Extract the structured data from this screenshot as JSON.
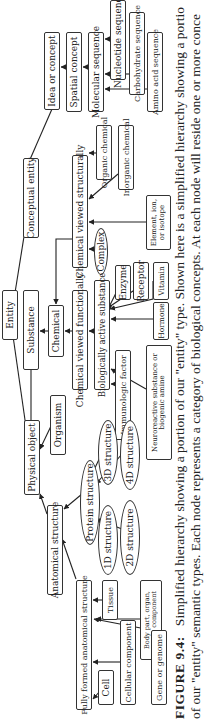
{
  "figure": {
    "caption_label": "FIGURE 9.4:",
    "caption_line1": "Simplified hierarchy showing a portion of our \"entity\" type. Shown here is a simplified hierarchy showing a portio",
    "caption_line2": "of our \"entity\" semantic types. Each node represents a category of biological concepts. At each node will reside one or more conce",
    "orientation": "rotated 90 degrees counter-clockwise"
  },
  "nodes": {
    "entity": "Entity",
    "physical_object": "Physical object",
    "conceptual_entity": "Conceptual entity",
    "idea_or_concept": "Idea or concept",
    "spatial_concept": "Spatial concept",
    "molecular_sequence": "Molecular sequence",
    "nucleotide_sequence": "Nucleotide sequence",
    "carbohydrate_sequence": "Carbohydrate sequence",
    "amino_acid_sequence": "Amino acid sequence",
    "substance": "Substance",
    "chemical": "Chemical",
    "chemical_viewed_structurally": "Chemical viewed structurally",
    "organic_chemical": "Organic chemical",
    "inorganic_chemical": "Inorganic chemical",
    "element_ion_isotope": "Element, ion, or isotope",
    "complex": "Complex",
    "chemical_viewed_functionally": "Chemical viewed functionally",
    "biologically_active_substance": "Biologically active substance",
    "enzyme": "Enzyme",
    "receptor": "Receptor",
    "vitamin": "Vitamin",
    "hormone": "Hormone",
    "immunologic_factor": "Immunologic factor",
    "neuroreactive_substance": "Neuroreactive substance or biogenic amine",
    "organism": "Organism",
    "anatomical_structure": "Anatomical structure",
    "protein_structure": "Protein structure",
    "structure_1d": "1D structure",
    "structure_2d": "2D structure",
    "structure_3d": "3D structure",
    "structure_4d": "4D structure",
    "fully_formed_anatomical_structure": "Fully formed anatomical structure",
    "cell": "Cell",
    "tissue": "Tissue",
    "cellular_component": "Cellular component",
    "body_part": "Body part, organ, organ component",
    "gene_or_genome": "Gene or genome"
  },
  "edges": [
    [
      "physical_object",
      "entity"
    ],
    [
      "conceptual_entity",
      "entity"
    ],
    [
      "idea_or_concept",
      "conceptual_entity"
    ],
    [
      "spatial_concept",
      "idea_or_concept"
    ],
    [
      "molecular_sequence",
      "spatial_concept"
    ],
    [
      "nucleotide_sequence",
      "molecular_sequence"
    ],
    [
      "carbohydrate_sequence",
      "molecular_sequence"
    ],
    [
      "amino_acid_sequence",
      "molecular_sequence"
    ],
    [
      "substance",
      "physical_object"
    ],
    [
      "chemical",
      "substance"
    ],
    [
      "chemical_viewed_functionally",
      "chemical"
    ],
    [
      "chemical_viewed_structurally",
      "chemical"
    ],
    [
      "organic_chemical",
      "chemical_viewed_structurally"
    ],
    [
      "inorganic_chemical",
      "chemical_viewed_structurally"
    ],
    [
      "element_ion_isotope",
      "chemical_viewed_structurally"
    ],
    [
      "complex",
      "chemical_viewed_structurally"
    ],
    [
      "biologically_active_substance",
      "chemical_viewed_functionally"
    ],
    [
      "enzyme",
      "biologically_active_substance"
    ],
    [
      "receptor",
      "biologically_active_substance"
    ],
    [
      "vitamin",
      "biologically_active_substance"
    ],
    [
      "hormone",
      "biologically_active_substance"
    ],
    [
      "immunologic_factor",
      "biologically_active_substance"
    ],
    [
      "neuroreactive_substance",
      "biologically_active_substance"
    ],
    [
      "organism",
      "physical_object"
    ],
    [
      "anatomical_structure",
      "physical_object"
    ],
    [
      "protein_structure",
      "anatomical_structure"
    ],
    [
      "structure_1d",
      "protein_structure"
    ],
    [
      "structure_2d",
      "protein_structure"
    ],
    [
      "structure_3d",
      "protein_structure"
    ],
    [
      "structure_4d",
      "protein_structure"
    ],
    [
      "fully_formed_anatomical_structure",
      "anatomical_structure"
    ],
    [
      "cell",
      "fully_formed_anatomical_structure"
    ],
    [
      "tissue",
      "fully_formed_anatomical_structure"
    ],
    [
      "cellular_component",
      "fully_formed_anatomical_structure"
    ],
    [
      "body_part",
      "fully_formed_anatomical_structure"
    ],
    [
      "gene_or_genome",
      "fully_formed_anatomical_structure"
    ]
  ]
}
